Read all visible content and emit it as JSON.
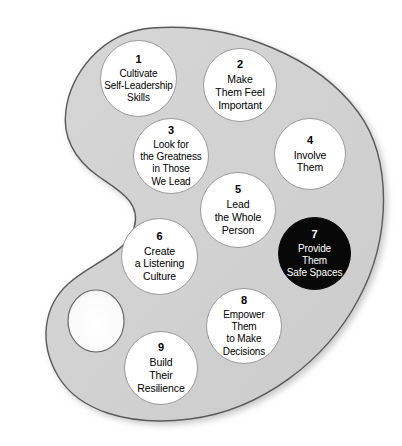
{
  "diagram": {
    "shape_name": "artist-palette",
    "colors": {
      "palette_fill": "#d2d2d2",
      "palette_outline": "#555555",
      "circle_fill": "#ffffff",
      "circle_outline": "#9a9a9a",
      "highlight_fill": "#080808",
      "highlight_text": "#ffffff",
      "background": "#ffffff"
    },
    "thumb_hole": {
      "name": "thumb-hole",
      "fill": "#ffffff"
    },
    "nodes": [
      {
        "number": "1",
        "lines": "Cultivate\nSelf-Leadership\nSkills",
        "style": "light"
      },
      {
        "number": "2",
        "lines": "Make\nThem Feel\nImportant",
        "style": "light"
      },
      {
        "number": "3",
        "lines": "Look for\nthe Greatness\nin Those\nWe Lead",
        "style": "light"
      },
      {
        "number": "4",
        "lines": "Involve\nThem",
        "style": "light"
      },
      {
        "number": "5",
        "lines": "Lead\nthe Whole\nPerson",
        "style": "light"
      },
      {
        "number": "6",
        "lines": "Create\na Listening\nCulture",
        "style": "light"
      },
      {
        "number": "7",
        "lines": "Provide\nThem\nSafe Spaces",
        "style": "dark"
      },
      {
        "number": "8",
        "lines": "Empower\nThem\nto Make\nDecisions",
        "style": "light"
      },
      {
        "number": "9",
        "lines": "Build\nTheir\nResilience",
        "style": "light"
      }
    ]
  }
}
